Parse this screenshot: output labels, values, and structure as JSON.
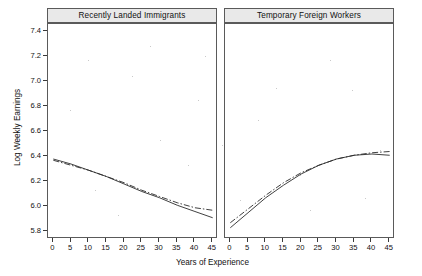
{
  "chart_data": {
    "type": "line",
    "title": "",
    "xlabel": "Years of Experience",
    "ylabel": "Log Weekly Earnings",
    "xlim": [
      -1.5,
      46.5
    ],
    "ylim": [
      5.74,
      7.46
    ],
    "xticks": [
      0,
      5,
      10,
      15,
      20,
      25,
      30,
      35,
      40,
      45
    ],
    "yticks": [
      5.8,
      6.0,
      6.2,
      6.4,
      6.6,
      6.8,
      7.0,
      7.2,
      7.4
    ],
    "ytick_labels": [
      "5.8",
      "6.0",
      "6.2",
      "6.4",
      "6.6",
      "6.8",
      "7.0",
      "7.2",
      "7.4"
    ],
    "xtick_labels": [
      "0",
      "5",
      "10",
      "15",
      "20",
      "25",
      "30",
      "35",
      "40",
      "45"
    ],
    "grid": false,
    "legend": "none",
    "panels": [
      {
        "label": "Recently Landed Immigrants",
        "x": [
          0,
          5,
          10,
          15,
          20,
          25,
          30,
          35,
          40,
          45
        ],
        "series": [
          {
            "name": "solid-fit",
            "style": "solid",
            "values": [
              6.38,
              6.34,
              6.29,
              6.24,
              6.18,
              6.12,
              6.07,
              6.01,
              5.96,
              5.91
            ]
          },
          {
            "name": "dashdot-fit",
            "style": "dashdot",
            "values": [
              6.37,
              6.33,
              6.29,
              6.24,
              6.19,
              6.13,
              6.08,
              6.03,
              5.99,
              5.97
            ]
          }
        ]
      },
      {
        "label": "Temporary Foreign Workers",
        "x": [
          0,
          5,
          10,
          15,
          20,
          25,
          30,
          35,
          40,
          45
        ],
        "series": [
          {
            "name": "solid-fit",
            "style": "solid",
            "values": [
              5.83,
              5.95,
              6.07,
              6.17,
              6.26,
              6.33,
              6.38,
              6.41,
              6.42,
              6.41
            ]
          },
          {
            "name": "dashdot-fit",
            "style": "dashdot",
            "values": [
              5.87,
              5.98,
              6.09,
              6.19,
              6.27,
              6.33,
              6.38,
              6.41,
              6.43,
              6.44
            ]
          }
        ]
      }
    ]
  },
  "axis": {
    "ylabel": "Log Weekly Earnings",
    "xlabel": "Years of Experience",
    "ytick_labels": [
      "7.4",
      "7.2",
      "7.0",
      "6.8",
      "6.6",
      "6.4",
      "6.2",
      "6.0",
      "5.8"
    ],
    "xtick_labels": [
      "0",
      "5",
      "10",
      "15",
      "20",
      "25",
      "30",
      "35",
      "40",
      "45"
    ]
  },
  "panels": {
    "left_title": "Recently Landed Immigrants",
    "right_title": "Temporary Foreign Workers"
  }
}
